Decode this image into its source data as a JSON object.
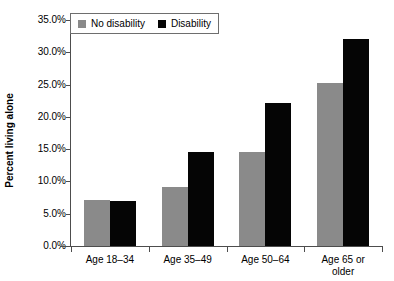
{
  "chart_data": {
    "type": "bar",
    "title": "",
    "xlabel": "",
    "ylabel": "Percent living alone",
    "ylim": [
      0,
      35
    ],
    "ytick_labels": [
      "0.0%",
      "5.0%",
      "10.0%",
      "15.0%",
      "20.0%",
      "25.0%",
      "30.0%",
      "35.0%"
    ],
    "ytick_values": [
      0,
      5,
      10,
      15,
      20,
      25,
      30,
      35
    ],
    "grid": false,
    "legend_position": "top-left",
    "categories": [
      "Age 18–34",
      "Age 35–49",
      "Age 50–64",
      "Age 65 or older"
    ],
    "series": [
      {
        "name": "No disability",
        "color": "#8a8a8a",
        "values": [
          7.2,
          9.2,
          14.5,
          25.2
        ]
      },
      {
        "name": "Disability",
        "color": "#050505",
        "values": [
          7.0,
          14.5,
          22.2,
          32.0
        ]
      }
    ]
  },
  "legend": {
    "entries": [
      {
        "label": "No disability"
      },
      {
        "label": "Disability"
      }
    ]
  },
  "axes": {
    "y_title": "Percent living alone"
  }
}
